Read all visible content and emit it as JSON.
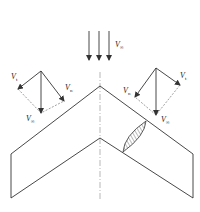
{
  "diagram": {
    "colors": {
      "line": "#333333",
      "dashed": "#777777",
      "centerline": "#888888",
      "hatch": "#555555"
    },
    "freestream": {
      "label_main": "V",
      "label_sub": "∞"
    },
    "left_vectors": {
      "tangential": {
        "label_main": "V",
        "label_sub": "t"
      },
      "normal": {
        "label_main": "V",
        "label_sub": "n"
      },
      "freestream": {
        "label_main": "V",
        "label_sub": "∞"
      }
    },
    "right_vectors": {
      "tangential": {
        "label_main": "V",
        "label_sub": "t"
      },
      "normal": {
        "label_main": "V",
        "label_sub": "n"
      },
      "freestream": {
        "label_main": "V",
        "label_sub": "∞"
      }
    }
  }
}
